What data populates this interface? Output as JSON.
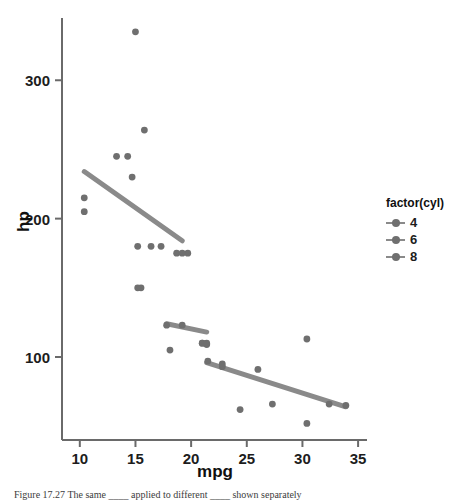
{
  "figure": {
    "caption": "Figure 17.27  The same ____ applied to different ____ shown separately",
    "caption_label": "Figure 17.27"
  },
  "legend": {
    "title": "factor(cyl)",
    "position": "right",
    "items": [
      {
        "label": "4",
        "key": "point-line-key"
      },
      {
        "label": "6",
        "key": "point-line-key"
      },
      {
        "label": "8",
        "key": "point-line-key"
      }
    ]
  },
  "colors": {
    "point": "#6f6f6f",
    "line": "#8a8a8a",
    "axis": "#6a6a6a",
    "text": "#1d1d1d",
    "background": "#ffffff"
  },
  "chart_data": {
    "type": "scatter",
    "title": "",
    "xlabel": "mpg",
    "ylabel": "hp",
    "xlim": [
      8.4,
      35.8
    ],
    "ylim": [
      40,
      345
    ],
    "xticks": [
      10,
      15,
      20,
      25,
      30,
      35
    ],
    "yticks": [
      100,
      200,
      300
    ],
    "grid": false,
    "legend_position": "right",
    "legend_title": "factor(cyl)",
    "series": [
      {
        "name": "4",
        "label": "4",
        "color": "#6f6f6f",
        "points": [
          {
            "x": 22.8,
            "y": 93
          },
          {
            "x": 24.4,
            "y": 62
          },
          {
            "x": 22.8,
            "y": 95
          },
          {
            "x": 32.4,
            "y": 66
          },
          {
            "x": 30.4,
            "y": 52
          },
          {
            "x": 33.9,
            "y": 65
          },
          {
            "x": 21.5,
            "y": 97
          },
          {
            "x": 27.3,
            "y": 66
          },
          {
            "x": 26.0,
            "y": 91
          },
          {
            "x": 30.4,
            "y": 113
          },
          {
            "x": 21.4,
            "y": 109
          }
        ],
        "fit": {
          "x0": 21.4,
          "y0": 96,
          "x1": 33.9,
          "y1": 64
        }
      },
      {
        "name": "6",
        "label": "6",
        "color": "#6f6f6f",
        "points": [
          {
            "x": 21.0,
            "y": 110
          },
          {
            "x": 21.0,
            "y": 110
          },
          {
            "x": 21.4,
            "y": 110
          },
          {
            "x": 18.1,
            "y": 105
          },
          {
            "x": 19.2,
            "y": 123
          },
          {
            "x": 17.8,
            "y": 123
          },
          {
            "x": 19.7,
            "y": 175
          }
        ],
        "fit": {
          "x0": 17.8,
          "y0": 124,
          "x1": 21.4,
          "y1": 118
        }
      },
      {
        "name": "8",
        "label": "8",
        "color": "#6f6f6f",
        "points": [
          {
            "x": 18.7,
            "y": 175
          },
          {
            "x": 14.3,
            "y": 245
          },
          {
            "x": 16.4,
            "y": 180
          },
          {
            "x": 17.3,
            "y": 180
          },
          {
            "x": 15.2,
            "y": 180
          },
          {
            "x": 10.4,
            "y": 205
          },
          {
            "x": 10.4,
            "y": 215
          },
          {
            "x": 14.7,
            "y": 230
          },
          {
            "x": 15.5,
            "y": 150
          },
          {
            "x": 15.2,
            "y": 150
          },
          {
            "x": 13.3,
            "y": 245
          },
          {
            "x": 19.2,
            "y": 175
          },
          {
            "x": 15.8,
            "y": 264
          },
          {
            "x": 15.0,
            "y": 335
          }
        ],
        "fit": {
          "x0": 10.4,
          "y0": 234,
          "x1": 19.2,
          "y1": 184
        }
      }
    ]
  }
}
